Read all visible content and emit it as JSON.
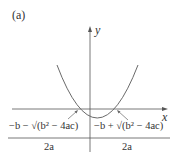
{
  "figure": {
    "panel_label": "(a)",
    "axes": {
      "x_label": "x",
      "y_label": "y"
    },
    "curve": "upward-opening parabola crossing the x-axis at two roots",
    "roots": {
      "left": {
        "numerator": "−b − √(b² − 4ac)",
        "denominator": "2a"
      },
      "right": {
        "numerator": "−b + √(b² − 4ac)",
        "denominator": "2a"
      }
    },
    "colors": {
      "axis": "#555555",
      "curve": "#6a6a6a",
      "text": "#333333"
    }
  }
}
